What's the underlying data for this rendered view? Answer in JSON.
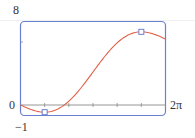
{
  "chart_data": {
    "type": "line",
    "title": "",
    "function": "f(x) = x - 2 sin x",
    "xlabel": "",
    "ylabel": "",
    "xlim": [
      0,
      6.2832
    ],
    "ylim": [
      -1,
      8
    ],
    "x_tick_labels": [
      "0",
      "2π"
    ],
    "y_tick_labels": [
      "8",
      "0",
      "-1"
    ],
    "x_ticks_count": 6,
    "x_tick_step": "π/3",
    "grid": false,
    "legend": null,
    "series": [
      {
        "name": "f(x)",
        "color": "#e0604a",
        "x": [
          0,
          0.5236,
          1.0472,
          1.5708,
          2.0944,
          2.618,
          3.1416,
          3.6652,
          4.1888,
          4.7124,
          5.236,
          5.7596,
          6.2832
        ],
        "y": [
          0,
          -0.476,
          -0.685,
          -0.429,
          0.362,
          1.618,
          3.142,
          4.665,
          5.92,
          6.712,
          6.968,
          6.76,
          6.283
        ]
      }
    ],
    "marked_points": [
      {
        "label": "local minimum",
        "x": 1.0472,
        "y": -0.685
      },
      {
        "label": "local maximum",
        "x": 5.236,
        "y": 6.968
      }
    ]
  },
  "labels": {
    "y_top": "8",
    "y_zero": "0",
    "y_bottom": "−1",
    "x_right": "2π"
  },
  "colors": {
    "frame": "#6b7fd0",
    "curve": "#e0604a",
    "axis": "#8a8a8a",
    "marker": "#6b7fd0"
  }
}
